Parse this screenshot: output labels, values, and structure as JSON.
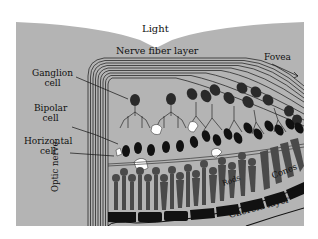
{
  "labels": {
    "light": "Light",
    "nerve_fiber_layer": "Nerve fiber layer",
    "fovea": "Fovea",
    "ganglion_cell_line1": "Ganglion",
    "ganglion_cell_line2": "cell",
    "bipolar_cell_line1": "Bipolar",
    "bipolar_cell_line2": "cell",
    "horizontal_cell_line1": "Horizontal",
    "horizontal_cell_line2": "cell",
    "optic_nerve": "Optic nerve",
    "rods": "Rods",
    "cones": "Cones",
    "choroid_layer": "Choroid layer"
  },
  "colors": {
    "panel": "#b4b4b4",
    "cell_dark": "#222222",
    "cell_mid": "#505050",
    "highlight": "#ffffff",
    "pigment": "#111111"
  }
}
